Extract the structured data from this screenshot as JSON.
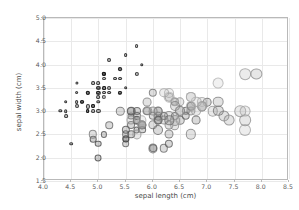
{
  "chart_data": {
    "type": "scatter",
    "title": "",
    "xlabel": "sepal length (cm)",
    "ylabel": "sepal width (cm)",
    "xlim": [
      4.0,
      8.5
    ],
    "ylim": [
      1.5,
      5.0
    ],
    "xticks": [
      "4.0",
      "4.5",
      "5.0",
      "5.5",
      "6.0",
      "6.5",
      "7.0",
      "7.5",
      "8.0",
      "8.5"
    ],
    "yticks": [
      "1.5",
      "2.0",
      "2.5",
      "3.0",
      "3.5",
      "4.0",
      "4.5",
      "5.0"
    ],
    "xtick_values": [
      4.0,
      4.5,
      5.0,
      5.5,
      6.0,
      6.5,
      7.0,
      7.5,
      8.0,
      8.5
    ],
    "ytick_values": [
      1.5,
      2.0,
      2.5,
      3.0,
      3.5,
      4.0,
      4.5,
      5.0
    ],
    "grid": true,
    "legend": "none",
    "size_encoding": "petal length (cm)",
    "shade_encoding": "petal width (cm)",
    "marker_style": "open circle, gray outline, translucent fill",
    "colors": {
      "background": "#ffffff",
      "grid": "#e9e9e9",
      "frame": "#b9b9b9",
      "tick_text": "#5a5a5a",
      "axis_title": "#4a4a4a",
      "marker_dark": "#2b2b2b",
      "marker_light": "#d8d8d8"
    },
    "points": [
      {
        "x": 5.1,
        "y": 3.5,
        "s": 1.4,
        "d": 0.2
      },
      {
        "x": 4.9,
        "y": 3.0,
        "s": 1.4,
        "d": 0.2
      },
      {
        "x": 4.7,
        "y": 3.2,
        "s": 1.3,
        "d": 0.2
      },
      {
        "x": 4.6,
        "y": 3.1,
        "s": 1.5,
        "d": 0.2
      },
      {
        "x": 5.0,
        "y": 3.6,
        "s": 1.4,
        "d": 0.2
      },
      {
        "x": 5.4,
        "y": 3.9,
        "s": 1.7,
        "d": 0.4
      },
      {
        "x": 4.6,
        "y": 3.4,
        "s": 1.4,
        "d": 0.3
      },
      {
        "x": 5.0,
        "y": 3.4,
        "s": 1.5,
        "d": 0.2
      },
      {
        "x": 4.4,
        "y": 2.9,
        "s": 1.4,
        "d": 0.2
      },
      {
        "x": 4.9,
        "y": 3.1,
        "s": 1.5,
        "d": 0.1
      },
      {
        "x": 5.4,
        "y": 3.7,
        "s": 1.5,
        "d": 0.2
      },
      {
        "x": 4.8,
        "y": 3.4,
        "s": 1.6,
        "d": 0.2
      },
      {
        "x": 4.8,
        "y": 3.0,
        "s": 1.4,
        "d": 0.1
      },
      {
        "x": 4.3,
        "y": 3.0,
        "s": 1.1,
        "d": 0.1
      },
      {
        "x": 5.8,
        "y": 4.0,
        "s": 1.2,
        "d": 0.2
      },
      {
        "x": 5.7,
        "y": 4.4,
        "s": 1.5,
        "d": 0.4
      },
      {
        "x": 5.4,
        "y": 3.9,
        "s": 1.3,
        "d": 0.4
      },
      {
        "x": 5.1,
        "y": 3.5,
        "s": 1.4,
        "d": 0.3
      },
      {
        "x": 5.7,
        "y": 3.8,
        "s": 1.7,
        "d": 0.3
      },
      {
        "x": 5.1,
        "y": 3.8,
        "s": 1.5,
        "d": 0.3
      },
      {
        "x": 5.4,
        "y": 3.4,
        "s": 1.7,
        "d": 0.2
      },
      {
        "x": 5.1,
        "y": 3.7,
        "s": 1.5,
        "d": 0.4
      },
      {
        "x": 4.6,
        "y": 3.6,
        "s": 1.0,
        "d": 0.2
      },
      {
        "x": 5.1,
        "y": 3.3,
        "s": 1.7,
        "d": 0.5
      },
      {
        "x": 4.8,
        "y": 3.4,
        "s": 1.9,
        "d": 0.2
      },
      {
        "x": 5.0,
        "y": 3.0,
        "s": 1.6,
        "d": 0.2
      },
      {
        "x": 5.0,
        "y": 3.4,
        "s": 1.6,
        "d": 0.4
      },
      {
        "x": 5.2,
        "y": 3.5,
        "s": 1.5,
        "d": 0.2
      },
      {
        "x": 5.2,
        "y": 3.4,
        "s": 1.4,
        "d": 0.2
      },
      {
        "x": 4.7,
        "y": 3.2,
        "s": 1.6,
        "d": 0.2
      },
      {
        "x": 4.8,
        "y": 3.1,
        "s": 1.6,
        "d": 0.2
      },
      {
        "x": 5.4,
        "y": 3.4,
        "s": 1.5,
        "d": 0.4
      },
      {
        "x": 5.2,
        "y": 4.1,
        "s": 1.5,
        "d": 0.1
      },
      {
        "x": 5.5,
        "y": 4.2,
        "s": 1.4,
        "d": 0.2
      },
      {
        "x": 4.9,
        "y": 3.1,
        "s": 1.5,
        "d": 0.2
      },
      {
        "x": 5.0,
        "y": 3.2,
        "s": 1.2,
        "d": 0.2
      },
      {
        "x": 5.5,
        "y": 3.5,
        "s": 1.3,
        "d": 0.2
      },
      {
        "x": 4.9,
        "y": 3.6,
        "s": 1.4,
        "d": 0.1
      },
      {
        "x": 4.4,
        "y": 3.0,
        "s": 1.3,
        "d": 0.2
      },
      {
        "x": 5.1,
        "y": 3.4,
        "s": 1.5,
        "d": 0.2
      },
      {
        "x": 5.0,
        "y": 3.5,
        "s": 1.3,
        "d": 0.3
      },
      {
        "x": 4.5,
        "y": 2.3,
        "s": 1.3,
        "d": 0.3
      },
      {
        "x": 4.4,
        "y": 3.2,
        "s": 1.3,
        "d": 0.2
      },
      {
        "x": 5.0,
        "y": 3.5,
        "s": 1.6,
        "d": 0.6
      },
      {
        "x": 5.1,
        "y": 3.8,
        "s": 1.9,
        "d": 0.4
      },
      {
        "x": 4.8,
        "y": 3.0,
        "s": 1.4,
        "d": 0.3
      },
      {
        "x": 5.1,
        "y": 3.8,
        "s": 1.6,
        "d": 0.2
      },
      {
        "x": 4.6,
        "y": 3.2,
        "s": 1.4,
        "d": 0.2
      },
      {
        "x": 5.3,
        "y": 3.7,
        "s": 1.5,
        "d": 0.2
      },
      {
        "x": 5.0,
        "y": 3.3,
        "s": 1.4,
        "d": 0.2
      },
      {
        "x": 7.0,
        "y": 3.2,
        "s": 4.7,
        "d": 1.4
      },
      {
        "x": 6.4,
        "y": 3.2,
        "s": 4.5,
        "d": 1.5
      },
      {
        "x": 6.9,
        "y": 3.1,
        "s": 4.9,
        "d": 1.5
      },
      {
        "x": 5.5,
        "y": 2.3,
        "s": 4.0,
        "d": 1.3
      },
      {
        "x": 6.5,
        "y": 2.8,
        "s": 4.6,
        "d": 1.5
      },
      {
        "x": 5.7,
        "y": 2.8,
        "s": 4.5,
        "d": 1.3
      },
      {
        "x": 6.3,
        "y": 3.3,
        "s": 4.7,
        "d": 1.6
      },
      {
        "x": 4.9,
        "y": 2.4,
        "s": 3.3,
        "d": 1.0
      },
      {
        "x": 6.6,
        "y": 2.9,
        "s": 4.6,
        "d": 1.3
      },
      {
        "x": 5.2,
        "y": 2.7,
        "s": 3.9,
        "d": 1.4
      },
      {
        "x": 5.0,
        "y": 2.0,
        "s": 3.5,
        "d": 1.0
      },
      {
        "x": 5.9,
        "y": 3.0,
        "s": 4.2,
        "d": 1.5
      },
      {
        "x": 6.0,
        "y": 2.2,
        "s": 4.0,
        "d": 1.0
      },
      {
        "x": 6.1,
        "y": 2.9,
        "s": 4.7,
        "d": 1.4
      },
      {
        "x": 5.6,
        "y": 2.9,
        "s": 3.6,
        "d": 1.3
      },
      {
        "x": 6.7,
        "y": 3.1,
        "s": 4.4,
        "d": 1.4
      },
      {
        "x": 5.6,
        "y": 3.0,
        "s": 4.5,
        "d": 1.5
      },
      {
        "x": 5.8,
        "y": 2.7,
        "s": 4.1,
        "d": 1.0
      },
      {
        "x": 6.2,
        "y": 2.2,
        "s": 4.5,
        "d": 1.5
      },
      {
        "x": 5.6,
        "y": 2.5,
        "s": 3.9,
        "d": 1.1
      },
      {
        "x": 5.9,
        "y": 3.2,
        "s": 4.8,
        "d": 1.8
      },
      {
        "x": 6.1,
        "y": 2.8,
        "s": 4.0,
        "d": 1.3
      },
      {
        "x": 6.3,
        "y": 2.5,
        "s": 4.9,
        "d": 1.5
      },
      {
        "x": 6.1,
        "y": 2.8,
        "s": 4.7,
        "d": 1.2
      },
      {
        "x": 6.4,
        "y": 2.9,
        "s": 4.3,
        "d": 1.3
      },
      {
        "x": 6.6,
        "y": 3.0,
        "s": 4.4,
        "d": 1.4
      },
      {
        "x": 6.8,
        "y": 2.8,
        "s": 4.8,
        "d": 1.4
      },
      {
        "x": 6.7,
        "y": 3.0,
        "s": 5.0,
        "d": 1.7
      },
      {
        "x": 6.0,
        "y": 2.9,
        "s": 4.5,
        "d": 1.5
      },
      {
        "x": 5.7,
        "y": 2.6,
        "s": 3.5,
        "d": 1.0
      },
      {
        "x": 5.5,
        "y": 2.4,
        "s": 3.8,
        "d": 1.1
      },
      {
        "x": 5.5,
        "y": 2.4,
        "s": 3.7,
        "d": 1.0
      },
      {
        "x": 5.8,
        "y": 2.7,
        "s": 3.9,
        "d": 1.2
      },
      {
        "x": 6.0,
        "y": 2.7,
        "s": 5.1,
        "d": 1.6
      },
      {
        "x": 5.4,
        "y": 3.0,
        "s": 4.5,
        "d": 1.5
      },
      {
        "x": 6.0,
        "y": 3.4,
        "s": 4.5,
        "d": 1.6
      },
      {
        "x": 6.7,
        "y": 3.1,
        "s": 4.7,
        "d": 1.5
      },
      {
        "x": 6.3,
        "y": 2.3,
        "s": 4.4,
        "d": 1.3
      },
      {
        "x": 5.6,
        "y": 3.0,
        "s": 4.1,
        "d": 1.3
      },
      {
        "x": 5.5,
        "y": 2.5,
        "s": 4.0,
        "d": 1.3
      },
      {
        "x": 5.5,
        "y": 2.6,
        "s": 4.4,
        "d": 1.2
      },
      {
        "x": 6.1,
        "y": 3.0,
        "s": 4.6,
        "d": 1.4
      },
      {
        "x": 5.8,
        "y": 2.6,
        "s": 4.0,
        "d": 1.2
      },
      {
        "x": 5.0,
        "y": 2.3,
        "s": 3.3,
        "d": 1.0
      },
      {
        "x": 5.6,
        "y": 2.7,
        "s": 4.2,
        "d": 1.3
      },
      {
        "x": 5.7,
        "y": 3.0,
        "s": 4.2,
        "d": 1.2
      },
      {
        "x": 5.7,
        "y": 2.9,
        "s": 4.2,
        "d": 1.3
      },
      {
        "x": 6.2,
        "y": 2.9,
        "s": 4.3,
        "d": 1.3
      },
      {
        "x": 5.1,
        "y": 2.5,
        "s": 3.0,
        "d": 1.1
      },
      {
        "x": 5.7,
        "y": 2.8,
        "s": 4.1,
        "d": 1.3
      },
      {
        "x": 6.3,
        "y": 3.3,
        "s": 6.0,
        "d": 2.5
      },
      {
        "x": 5.8,
        "y": 2.7,
        "s": 5.1,
        "d": 1.9
      },
      {
        "x": 7.1,
        "y": 3.0,
        "s": 5.9,
        "d": 2.1
      },
      {
        "x": 6.3,
        "y": 2.9,
        "s": 5.6,
        "d": 1.8
      },
      {
        "x": 6.5,
        "y": 3.0,
        "s": 5.8,
        "d": 2.2
      },
      {
        "x": 7.6,
        "y": 3.0,
        "s": 6.6,
        "d": 2.1
      },
      {
        "x": 4.9,
        "y": 2.5,
        "s": 4.5,
        "d": 1.7
      },
      {
        "x": 7.3,
        "y": 2.9,
        "s": 6.3,
        "d": 1.8
      },
      {
        "x": 6.7,
        "y": 2.5,
        "s": 5.8,
        "d": 1.8
      },
      {
        "x": 7.2,
        "y": 3.6,
        "s": 6.1,
        "d": 2.5
      },
      {
        "x": 6.5,
        "y": 3.2,
        "s": 5.1,
        "d": 2.0
      },
      {
        "x": 6.4,
        "y": 2.7,
        "s": 5.3,
        "d": 1.9
      },
      {
        "x": 6.8,
        "y": 3.0,
        "s": 5.5,
        "d": 2.1
      },
      {
        "x": 5.7,
        "y": 2.5,
        "s": 5.0,
        "d": 2.0
      },
      {
        "x": 5.8,
        "y": 2.8,
        "s": 5.1,
        "d": 2.4
      },
      {
        "x": 6.4,
        "y": 3.2,
        "s": 5.3,
        "d": 2.3
      },
      {
        "x": 6.5,
        "y": 3.0,
        "s": 5.5,
        "d": 1.8
      },
      {
        "x": 7.7,
        "y": 3.8,
        "s": 6.7,
        "d": 2.2
      },
      {
        "x": 7.7,
        "y": 2.6,
        "s": 6.9,
        "d": 2.3
      },
      {
        "x": 6.0,
        "y": 2.2,
        "s": 5.0,
        "d": 1.5
      },
      {
        "x": 6.9,
        "y": 3.2,
        "s": 5.7,
        "d": 2.3
      },
      {
        "x": 5.6,
        "y": 2.8,
        "s": 4.9,
        "d": 2.0
      },
      {
        "x": 7.7,
        "y": 2.8,
        "s": 6.7,
        "d": 2.0
      },
      {
        "x": 6.3,
        "y": 2.7,
        "s": 4.9,
        "d": 1.8
      },
      {
        "x": 6.7,
        "y": 3.3,
        "s": 5.7,
        "d": 2.1
      },
      {
        "x": 7.2,
        "y": 3.2,
        "s": 6.0,
        "d": 1.8
      },
      {
        "x": 6.2,
        "y": 2.8,
        "s": 4.8,
        "d": 1.8
      },
      {
        "x": 6.1,
        "y": 3.0,
        "s": 4.9,
        "d": 1.8
      },
      {
        "x": 6.4,
        "y": 2.8,
        "s": 5.6,
        "d": 2.1
      },
      {
        "x": 7.2,
        "y": 3.0,
        "s": 5.8,
        "d": 1.6
      },
      {
        "x": 7.4,
        "y": 2.8,
        "s": 6.1,
        "d": 1.9
      },
      {
        "x": 7.9,
        "y": 3.8,
        "s": 6.4,
        "d": 2.0
      },
      {
        "x": 6.4,
        "y": 2.8,
        "s": 5.6,
        "d": 2.2
      },
      {
        "x": 6.3,
        "y": 2.8,
        "s": 5.1,
        "d": 1.5
      },
      {
        "x": 6.1,
        "y": 2.6,
        "s": 5.6,
        "d": 1.4
      },
      {
        "x": 7.7,
        "y": 3.0,
        "s": 6.1,
        "d": 2.3
      },
      {
        "x": 6.3,
        "y": 3.4,
        "s": 5.6,
        "d": 2.4
      },
      {
        "x": 6.4,
        "y": 3.1,
        "s": 5.5,
        "d": 1.8
      },
      {
        "x": 6.0,
        "y": 3.0,
        "s": 4.8,
        "d": 1.8
      },
      {
        "x": 6.9,
        "y": 3.1,
        "s": 5.4,
        "d": 2.1
      },
      {
        "x": 6.7,
        "y": 3.1,
        "s": 5.6,
        "d": 2.4
      },
      {
        "x": 6.9,
        "y": 3.1,
        "s": 5.1,
        "d": 2.3
      },
      {
        "x": 5.8,
        "y": 2.7,
        "s": 5.1,
        "d": 1.9
      },
      {
        "x": 6.8,
        "y": 3.2,
        "s": 5.9,
        "d": 2.3
      },
      {
        "x": 6.7,
        "y": 3.3,
        "s": 5.7,
        "d": 2.5
      },
      {
        "x": 6.2,
        "y": 3.4,
        "s": 5.4,
        "d": 2.3
      },
      {
        "x": 5.9,
        "y": 3.0,
        "s": 5.1,
        "d": 1.8
      }
    ]
  }
}
